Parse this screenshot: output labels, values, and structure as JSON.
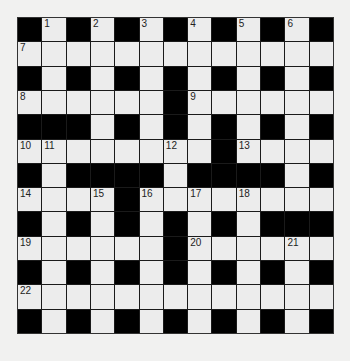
{
  "puzzle": {
    "rows": 13,
    "cols": 13,
    "grid": [
      "#.#.#.#.#.#.#",
      ".............",
      "#.#.#.#.#.#.#",
      "......#......",
      "###.#.#.#.#.#",
      "........#....",
      "#.####.####.#",
      "....#........",
      "#.#.#.#.#.###",
      "......#......",
      "#.#.#.#.#.#.#",
      ".............",
      "#.#.#.#.#.#.#"
    ],
    "numbers": [
      {
        "row": 0,
        "col": 1,
        "n": "1"
      },
      {
        "row": 0,
        "col": 3,
        "n": "2"
      },
      {
        "row": 0,
        "col": 5,
        "n": "3"
      },
      {
        "row": 0,
        "col": 7,
        "n": "4"
      },
      {
        "row": 0,
        "col": 9,
        "n": "5"
      },
      {
        "row": 0,
        "col": 11,
        "n": "6"
      },
      {
        "row": 1,
        "col": 0,
        "n": "7"
      },
      {
        "row": 3,
        "col": 0,
        "n": "8"
      },
      {
        "row": 3,
        "col": 7,
        "n": "9"
      },
      {
        "row": 5,
        "col": 0,
        "n": "10"
      },
      {
        "row": 5,
        "col": 1,
        "n": "11"
      },
      {
        "row": 5,
        "col": 6,
        "n": "12"
      },
      {
        "row": 5,
        "col": 9,
        "n": "13"
      },
      {
        "row": 7,
        "col": 0,
        "n": "14"
      },
      {
        "row": 7,
        "col": 3,
        "n": "15"
      },
      {
        "row": 7,
        "col": 5,
        "n": "16"
      },
      {
        "row": 7,
        "col": 7,
        "n": "17"
      },
      {
        "row": 7,
        "col": 9,
        "n": "18"
      },
      {
        "row": 9,
        "col": 0,
        "n": "19"
      },
      {
        "row": 9,
        "col": 7,
        "n": "20"
      },
      {
        "row": 9,
        "col": 11,
        "n": "21"
      },
      {
        "row": 11,
        "col": 0,
        "n": "22"
      }
    ]
  },
  "colors": {
    "block": "#000000",
    "cell": "#ececec",
    "background": "#f1f1f0"
  }
}
